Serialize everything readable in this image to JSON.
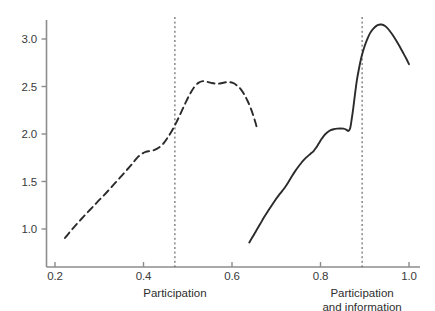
{
  "chart_data": {
    "type": "line",
    "title": "",
    "xlabel": "",
    "ylabel": "",
    "xlim": [
      0.175,
      1.02
    ],
    "ylim": [
      0.78,
      3.28
    ],
    "grid": false,
    "legend": null,
    "xticks": [
      0.2,
      0.4,
      0.6,
      0.8,
      1.0
    ],
    "xtick_labels": [
      "0.2",
      "0.4",
      "0.6",
      "0.8",
      "1.0"
    ],
    "yticks": [
      1.0,
      1.5,
      2.0,
      2.5,
      3.0
    ],
    "ytick_labels": [
      "1.0",
      "1.5",
      "2.0",
      "2.5",
      "3.0"
    ],
    "annotations": [
      {
        "name": "participation-reference",
        "type": "vline",
        "x": 0.471,
        "style": "dashed",
        "label": "Participation",
        "label_lines": [
          "Participation"
        ]
      },
      {
        "name": "participation-and-information-reference",
        "type": "vline",
        "x": 0.894,
        "style": "dashed",
        "label": "Participation and information",
        "label_lines": [
          "Participation",
          "and information"
        ]
      }
    ],
    "series": [
      {
        "name": "Participation",
        "style": "dashed",
        "color": "#2b2b2b",
        "points": [
          [
            0.2225,
            0.905
          ],
          [
            0.232,
            0.96
          ],
          [
            0.243,
            1.02
          ],
          [
            0.253,
            1.072
          ],
          [
            0.264,
            1.128
          ],
          [
            0.275,
            1.182
          ],
          [
            0.286,
            1.236
          ],
          [
            0.296,
            1.286
          ],
          [
            0.307,
            1.338
          ],
          [
            0.318,
            1.392
          ],
          [
            0.329,
            1.448
          ],
          [
            0.339,
            1.5
          ],
          [
            0.35,
            1.556
          ],
          [
            0.361,
            1.614
          ],
          [
            0.372,
            1.672
          ],
          [
            0.379,
            1.712
          ],
          [
            0.387,
            1.756
          ],
          [
            0.396,
            1.79
          ],
          [
            0.405,
            1.812
          ],
          [
            0.415,
            1.822
          ],
          [
            0.425,
            1.832
          ],
          [
            0.435,
            1.858
          ],
          [
            0.445,
            1.9
          ],
          [
            0.454,
            1.958
          ],
          [
            0.464,
            2.032
          ],
          [
            0.474,
            2.12
          ],
          [
            0.484,
            2.218
          ],
          [
            0.494,
            2.318
          ],
          [
            0.504,
            2.412
          ],
          [
            0.514,
            2.49
          ],
          [
            0.524,
            2.538
          ],
          [
            0.534,
            2.556
          ],
          [
            0.543,
            2.55
          ],
          [
            0.553,
            2.538
          ],
          [
            0.563,
            2.53
          ],
          [
            0.573,
            2.532
          ],
          [
            0.583,
            2.542
          ],
          [
            0.593,
            2.546
          ],
          [
            0.602,
            2.538
          ],
          [
            0.611,
            2.512
          ],
          [
            0.62,
            2.47
          ],
          [
            0.628,
            2.415
          ],
          [
            0.635,
            2.35
          ],
          [
            0.642,
            2.275
          ],
          [
            0.648,
            2.195
          ],
          [
            0.653,
            2.12
          ],
          [
            0.656,
            2.07
          ]
        ]
      },
      {
        "name": "Participation and information",
        "style": "solid",
        "color": "#2b2b2b",
        "points": [
          [
            0.639,
            0.858
          ],
          [
            0.647,
            0.92
          ],
          [
            0.655,
            0.985
          ],
          [
            0.664,
            1.055
          ],
          [
            0.672,
            1.12
          ],
          [
            0.681,
            1.186
          ],
          [
            0.69,
            1.25
          ],
          [
            0.698,
            1.306
          ],
          [
            0.706,
            1.356
          ],
          [
            0.714,
            1.404
          ],
          [
            0.721,
            1.448
          ],
          [
            0.728,
            1.498
          ],
          [
            0.735,
            1.552
          ],
          [
            0.742,
            1.604
          ],
          [
            0.749,
            1.65
          ],
          [
            0.756,
            1.692
          ],
          [
            0.763,
            1.73
          ],
          [
            0.77,
            1.762
          ],
          [
            0.777,
            1.79
          ],
          [
            0.784,
            1.818
          ],
          [
            0.79,
            1.856
          ],
          [
            0.796,
            1.9
          ],
          [
            0.802,
            1.944
          ],
          [
            0.808,
            1.984
          ],
          [
            0.815,
            2.016
          ],
          [
            0.822,
            2.038
          ],
          [
            0.83,
            2.05
          ],
          [
            0.838,
            2.056
          ],
          [
            0.845,
            2.058
          ],
          [
            0.852,
            2.056
          ],
          [
            0.858,
            2.046
          ],
          [
            0.863,
            2.032
          ],
          [
            0.867,
            2.06
          ],
          [
            0.87,
            2.14
          ],
          [
            0.874,
            2.27
          ],
          [
            0.878,
            2.42
          ],
          [
            0.882,
            2.56
          ],
          [
            0.887,
            2.69
          ],
          [
            0.892,
            2.8
          ],
          [
            0.898,
            2.9
          ],
          [
            0.905,
            2.99
          ],
          [
            0.912,
            3.062
          ],
          [
            0.92,
            3.112
          ],
          [
            0.929,
            3.146
          ],
          [
            0.938,
            3.152
          ],
          [
            0.946,
            3.136
          ],
          [
            0.954,
            3.1
          ],
          [
            0.962,
            3.05
          ],
          [
            0.97,
            2.992
          ],
          [
            0.978,
            2.928
          ],
          [
            0.986,
            2.86
          ],
          [
            0.994,
            2.792
          ],
          [
            1.0,
            2.735
          ]
        ]
      }
    ]
  },
  "axis": {
    "x_axis_name": "x-axis",
    "y_axis_name": "y-axis"
  }
}
